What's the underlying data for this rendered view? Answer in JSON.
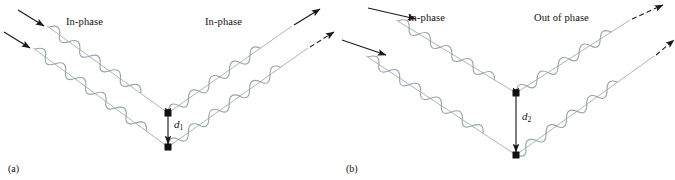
{
  "figure": {
    "type": "diagram",
    "background_color": "#ffffff",
    "wave_color": "#9aa3ae",
    "ray_color": "#8b8f96",
    "arrow_color": "#1a1a1a",
    "atom_color": "#111111"
  },
  "panels": [
    {
      "id": "a",
      "caption": "(a)",
      "incoming_label": "In-phase",
      "outgoing_label": "In-phase",
      "spacing_symbol": "d",
      "spacing_subscript": "1",
      "spacing_px": 34,
      "rays": 2,
      "atoms": 2,
      "incoming_arrows": 2,
      "outgoing_arrows": 2,
      "outgoing_in_phase": true
    },
    {
      "id": "b",
      "caption": "(b)",
      "incoming_label": "In-phase",
      "outgoing_label": "Out of phase",
      "spacing_symbol": "d",
      "spacing_subscript": "2",
      "spacing_px": 62,
      "rays": 2,
      "atoms": 2,
      "incoming_arrows": 2,
      "outgoing_arrows": 2,
      "outgoing_in_phase": false
    }
  ]
}
